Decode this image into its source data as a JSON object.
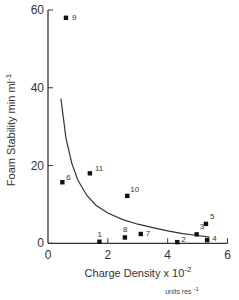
{
  "chart_data": {
    "type": "scatter",
    "title": "",
    "xlabel": "Charge Density x 10",
    "xlabel_exponent": "-2",
    "xlabel_units": "units res",
    "xlabel_units_exponent": "-1",
    "ylabel": "Foam Stability min ml",
    "ylabel_exponent": "-1",
    "xlim": [
      0,
      6
    ],
    "ylim": [
      0,
      60
    ],
    "x_ticks": [
      0,
      2,
      4,
      6
    ],
    "x_tick_labels": [
      "0",
      "2",
      "4",
      "6"
    ],
    "y_ticks": [
      0,
      20,
      40,
      60
    ],
    "y_tick_labels": [
      "0",
      "20",
      "40",
      "60"
    ],
    "grid": false,
    "legend": null,
    "series": [
      {
        "name": "samples",
        "marker": "square",
        "points": [
          {
            "label": "1",
            "x": 1.72,
            "y": 0.4
          },
          {
            "label": "2",
            "x": 4.32,
            "y": 0.3
          },
          {
            "label": "3",
            "x": 4.97,
            "y": 2.3
          },
          {
            "label": "4",
            "x": 5.32,
            "y": 0.8
          },
          {
            "label": "5",
            "x": 5.28,
            "y": 5.0
          },
          {
            "label": "6",
            "x": 0.48,
            "y": 15.7
          },
          {
            "label": "7",
            "x": 3.1,
            "y": 2.4
          },
          {
            "label": "8",
            "x": 2.57,
            "y": 1.5
          },
          {
            "label": "9",
            "x": 0.6,
            "y": 58.0
          },
          {
            "label": "10",
            "x": 2.65,
            "y": 12.2
          },
          {
            "label": "11",
            "x": 1.4,
            "y": 18.0
          }
        ]
      },
      {
        "name": "fitted curve",
        "type": "line",
        "points": [
          {
            "x": 0.43,
            "y": 37.2
          },
          {
            "x": 0.6,
            "y": 27.0
          },
          {
            "x": 0.8,
            "y": 20.5
          },
          {
            "x": 1.0,
            "y": 16.2
          },
          {
            "x": 1.3,
            "y": 12.3
          },
          {
            "x": 1.6,
            "y": 9.8
          },
          {
            "x": 2.0,
            "y": 7.8
          },
          {
            "x": 2.5,
            "y": 6.1
          },
          {
            "x": 3.0,
            "y": 4.9
          },
          {
            "x": 3.5,
            "y": 4.0
          },
          {
            "x": 4.0,
            "y": 3.2
          },
          {
            "x": 4.5,
            "y": 2.5
          },
          {
            "x": 5.0,
            "y": 2.0
          },
          {
            "x": 5.4,
            "y": 1.6
          }
        ]
      }
    ]
  }
}
